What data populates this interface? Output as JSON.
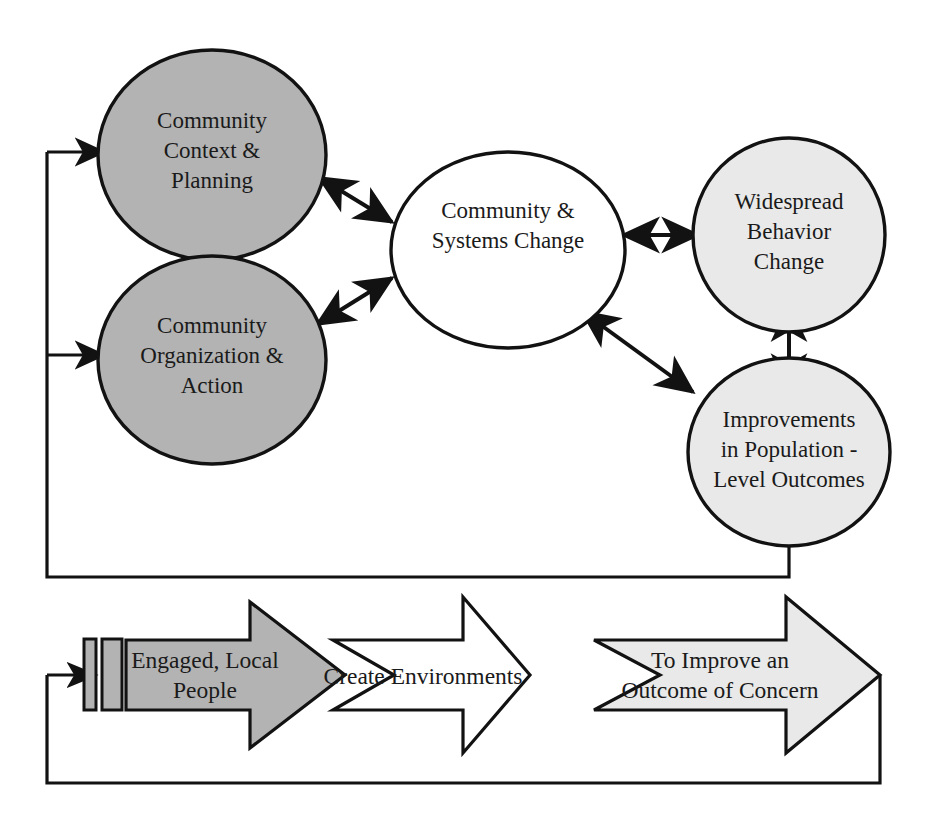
{
  "diagram": {
    "type": "cyclic-model-diagram",
    "colors": {
      "stroke": "#121212",
      "fill_dark_gray": "#b3b3b3",
      "fill_light_gray": "#e9e9e9",
      "fill_white": "#ffffff",
      "text": "#1a1a1a"
    },
    "nodes": [
      {
        "id": "community-context-planning",
        "label_lines": [
          "Community",
          "Context &",
          "Planning"
        ],
        "shape": "ellipse",
        "fill": "dark-gray"
      },
      {
        "id": "community-organization-action",
        "label_lines": [
          "Community",
          "Organization &",
          "Action"
        ],
        "shape": "ellipse",
        "fill": "dark-gray"
      },
      {
        "id": "community-systems-change",
        "label_lines": [
          "Community &",
          "Systems Change"
        ],
        "shape": "ellipse",
        "fill": "white"
      },
      {
        "id": "widespread-behavior-change",
        "label_lines": [
          "Widespread",
          "Behavior",
          "Change"
        ],
        "shape": "ellipse",
        "fill": "light-gray"
      },
      {
        "id": "improvements-population-level-outcomes",
        "label_lines": [
          "Improvements",
          "in Population -",
          "Level Outcomes"
        ],
        "shape": "ellipse",
        "fill": "light-gray"
      }
    ],
    "arrow_banners": [
      {
        "id": "engaged-local-people",
        "label_lines": [
          "Engaged, Local",
          "People"
        ],
        "fill": "dark-gray"
      },
      {
        "id": "create-environments",
        "label_lines": [
          "Create Environments"
        ],
        "fill": "white"
      },
      {
        "id": "to-improve-an-outcome-of-concern",
        "label_lines": [
          "To Improve an",
          "Outcome of Concern"
        ],
        "fill": "light-gray"
      }
    ],
    "connectors": [
      {
        "id": "context-to-systems",
        "kind": "double-headed-diagonal"
      },
      {
        "id": "organization-to-systems",
        "kind": "double-headed-diagonal"
      },
      {
        "id": "context-to-organization",
        "kind": "double-headed-vertical"
      },
      {
        "id": "systems-to-behavior",
        "kind": "double-headed-horizontal"
      },
      {
        "id": "systems-to-outcomes",
        "kind": "double-headed-diagonal"
      },
      {
        "id": "behavior-to-outcomes",
        "kind": "double-headed-vertical"
      },
      {
        "id": "outcomes-feedback-to-context",
        "kind": "feedback-loop-arrow"
      },
      {
        "id": "outcomes-feedback-to-organization",
        "kind": "feedback-loop-arrow"
      },
      {
        "id": "outcome-banner-feedback-to-engaged-people",
        "kind": "feedback-loop-arrow"
      }
    ]
  }
}
